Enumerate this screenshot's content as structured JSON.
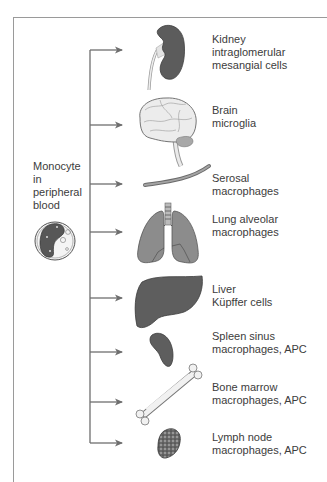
{
  "source": {
    "lines": [
      "Monocyte",
      "in",
      "peripheral",
      "blood"
    ],
    "icon": "monocyte-cell-icon"
  },
  "colors": {
    "frame": "#9a9a9a",
    "arrow": "#6e6e6e",
    "organ_dark": "#5a5a5a",
    "organ_mid": "#8a8a8a",
    "organ_light": "#e6e6e6",
    "text": "#3c3c3c"
  },
  "targets": [
    {
      "organ": "kidney",
      "icon": "kidney-icon",
      "lines": [
        "Kidney",
        "intraglomerular",
        "mesangial cells"
      ]
    },
    {
      "organ": "brain",
      "icon": "brain-icon",
      "lines": [
        "Brain",
        "microglia"
      ]
    },
    {
      "organ": "serosa",
      "icon": "serosal-tube-icon",
      "lines": [
        "Serosal",
        "macrophages"
      ]
    },
    {
      "organ": "lung",
      "icon": "lungs-icon",
      "lines": [
        "Lung alveolar",
        "macrophages"
      ]
    },
    {
      "organ": "liver",
      "icon": "liver-icon",
      "lines": [
        "Liver",
        "Küpffer cells"
      ]
    },
    {
      "organ": "spleen",
      "icon": "spleen-icon",
      "lines": [
        "Spleen sinus",
        "macrophages, APC"
      ]
    },
    {
      "organ": "bone-marrow",
      "icon": "bone-icon",
      "lines": [
        "Bone marrow",
        "macrophages, APC"
      ]
    },
    {
      "organ": "lymph-node",
      "icon": "lymph-node-icon",
      "lines": [
        "Lymph node",
        "macrophages, APC"
      ]
    }
  ]
}
